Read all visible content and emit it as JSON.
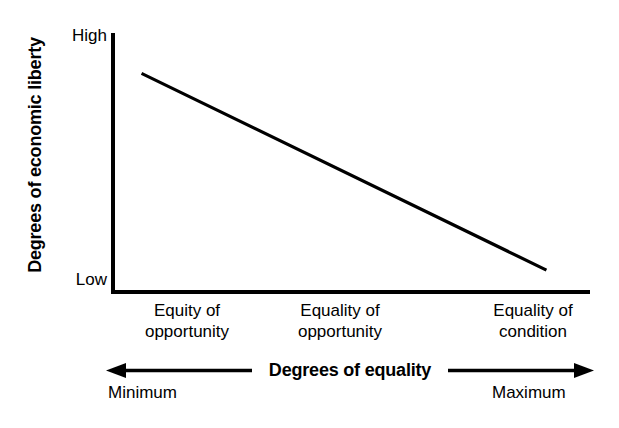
{
  "chart_data": {
    "type": "line",
    "title": "",
    "subtitle": "",
    "xlabel": "Degrees of equality",
    "ylabel": "Degrees of economic liberty",
    "categories": [
      "Equity of\nopportunity",
      "Equality of\nopportunity",
      "Equality of\ncondition"
    ],
    "x": [
      0,
      1,
      2
    ],
    "series": [
      {
        "name": "economic liberty vs equality",
        "values": [
          0.84,
          0.5,
          0.08
        ]
      }
    ],
    "y_tick_labels": [
      "High",
      "Low"
    ],
    "ylim": [
      0,
      1
    ],
    "xlim": [
      0,
      2
    ],
    "x_axis_extremes": [
      "Minimum",
      "Maximum"
    ],
    "grid": false,
    "legend": false,
    "annotation": "Downward sloping straight line: as degrees of equality increase from minimum to maximum, degrees of economic liberty decrease from high to low.",
    "line_color": "#000000",
    "axis_color": "#000000",
    "background_color": "#ffffff"
  },
  "axes": {
    "y_title": "Degrees of economic liberty",
    "y_high_label": "High",
    "y_low_label": "Low",
    "x_title": "Degrees of equality",
    "x_categories": [
      "Equity of\nopportunity",
      "Equality of\nopportunity",
      "Equality of\ncondition"
    ],
    "x_min_label": "Minimum",
    "x_max_label": "Maximum"
  }
}
